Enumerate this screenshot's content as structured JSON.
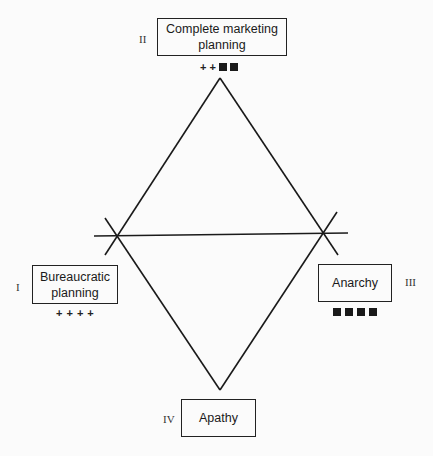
{
  "diagram": {
    "type": "diamond-quadrant",
    "nodes": [
      {
        "id": "I",
        "numeral": "I",
        "label": "Bureaucratic planning",
        "lines": [
          "Bureaucratic",
          "planning"
        ],
        "markers": "++++",
        "plus_count": 4,
        "square_count": 0
      },
      {
        "id": "II",
        "numeral": "II",
        "label": "Complete marketing planning",
        "lines": [
          "Complete marketing",
          "planning"
        ],
        "markers": "++■■",
        "plus_count": 2,
        "square_count": 2
      },
      {
        "id": "III",
        "numeral": "III",
        "label": "Anarchy",
        "lines": [
          "Anarchy"
        ],
        "markers": "■■■■",
        "plus_count": 0,
        "square_count": 4
      },
      {
        "id": "IV",
        "numeral": "IV",
        "label": "Apathy",
        "lines": [
          "Apathy"
        ],
        "markers": "",
        "plus_count": 0,
        "square_count": 0
      }
    ],
    "edges": [
      {
        "from": "II",
        "to": "I"
      },
      {
        "from": "II",
        "to": "III"
      },
      {
        "from": "I",
        "to": "IV"
      },
      {
        "from": "III",
        "to": "IV"
      },
      {
        "from": "I",
        "to": "III"
      }
    ]
  }
}
